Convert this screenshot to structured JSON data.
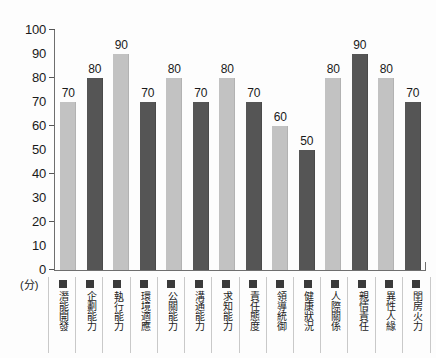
{
  "chart_data": {
    "type": "bar",
    "title": "",
    "xlabel": "",
    "ylabel": "",
    "unit_label": "(分)",
    "ylim": [
      0,
      100
    ],
    "ytick_step": 10,
    "grid": false,
    "legend_position": "bottom-axis",
    "yticks": [
      "100",
      "90",
      "80",
      "70",
      "60",
      "50",
      "40",
      "30",
      "20",
      "10",
      "0"
    ],
    "ytick_major": [
      100,
      80,
      60,
      40,
      20,
      0
    ],
    "categories": [
      "潛能開發",
      "企劃能力",
      "執行能力",
      "環境適應",
      "公關能力",
      "溝通能力",
      "求知能力",
      "責任態度",
      "領導統御",
      "健康狀況",
      "人際關係",
      "親情責任",
      "異性人緣",
      "閨房火力"
    ],
    "values": [
      70,
      80,
      90,
      70,
      80,
      70,
      80,
      70,
      60,
      50,
      80,
      90,
      80,
      70
    ],
    "value_labels": [
      "70",
      "80",
      "90",
      "70",
      "80",
      "70",
      "80",
      "70",
      "60",
      "50",
      "80",
      "90",
      "80",
      "70"
    ],
    "bar_shades": [
      "light",
      "dark",
      "light",
      "dark",
      "light",
      "dark",
      "light",
      "dark",
      "light",
      "dark",
      "light",
      "dark",
      "light",
      "dark"
    ],
    "colors": {
      "bar_light": "#c2c2c2",
      "bar_dark": "#555555",
      "axis": "#6e6e6e",
      "text": "#1a1a1a",
      "legend_swatch": "#3a3a3a",
      "cell_border": "#c9c9c9",
      "background": "#fdfdfd"
    }
  }
}
